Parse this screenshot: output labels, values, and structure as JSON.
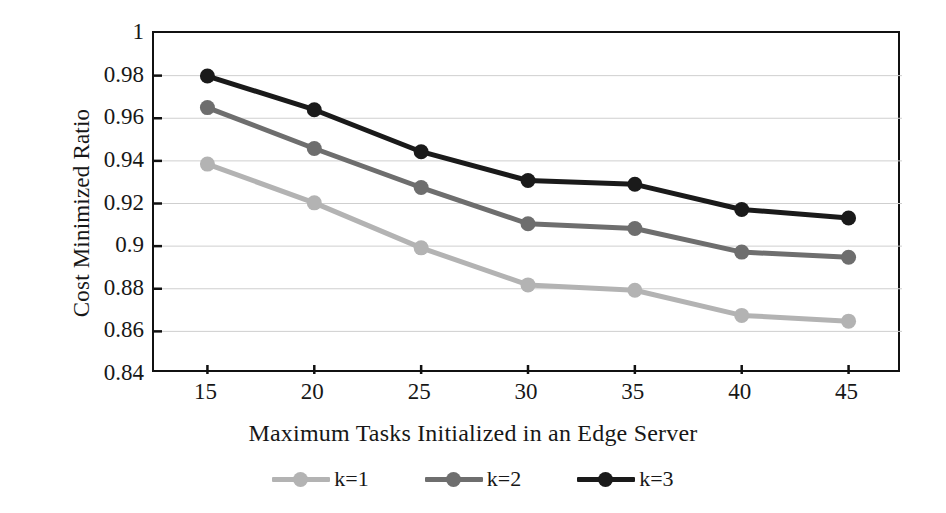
{
  "chart_data": {
    "type": "line",
    "title": "",
    "xlabel": "Maximum Tasks Initialized in an Edge Server",
    "ylabel": "Cost Minimized Ratio",
    "categories": [
      15,
      20,
      25,
      30,
      35,
      40,
      45
    ],
    "x_tick_labels": [
      "15",
      "20",
      "25",
      "30",
      "35",
      "40",
      "45"
    ],
    "y_tick_labels": [
      "1",
      "0.98",
      "0.96",
      "0.94",
      "0.92",
      "0.9",
      "0.88",
      "0.86",
      "0.84"
    ],
    "y_tick_values": [
      1,
      0.98,
      0.96,
      0.94,
      0.92,
      0.9,
      0.88,
      0.86,
      0.84
    ],
    "ylim": [
      0.84,
      1.0
    ],
    "grid": "horizontal",
    "legend_position": "bottom",
    "series": [
      {
        "name": "k=1",
        "color": "#b3b3b3",
        "values": [
          0.9385,
          0.9203,
          0.8992,
          0.8818,
          0.8793,
          0.8675,
          0.8648
        ]
      },
      {
        "name": "k=2",
        "color": "#6e6e6e",
        "values": [
          0.965,
          0.9458,
          0.9275,
          0.9105,
          0.9083,
          0.8972,
          0.8948
        ]
      },
      {
        "name": "k=3",
        "color": "#1a1a1a",
        "values": [
          0.9798,
          0.964,
          0.9443,
          0.9308,
          0.929,
          0.9172,
          0.9132
        ]
      }
    ]
  },
  "legend": {
    "items": [
      {
        "label": "k=1"
      },
      {
        "label": "k=2"
      },
      {
        "label": "k=3"
      }
    ]
  }
}
